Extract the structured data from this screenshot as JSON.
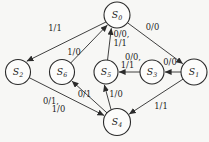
{
  "figure": {
    "type": "state-transition-diagram",
    "background_color": "#f7f7f5",
    "line_color": "#2b2b2b",
    "node_fill": "#fcfcfb",
    "states": [
      {
        "id": "s0",
        "base": "S",
        "sub": "0",
        "x": 117,
        "y": 15,
        "r": 13
      },
      {
        "id": "s1",
        "base": "S",
        "sub": "1",
        "x": 194,
        "y": 72,
        "r": 13
      },
      {
        "id": "s2",
        "base": "S",
        "sub": "2",
        "x": 18,
        "y": 72,
        "r": 12.5
      },
      {
        "id": "s3",
        "base": "S",
        "sub": "3",
        "x": 152,
        "y": 72,
        "r": 12
      },
      {
        "id": "s4",
        "base": "S",
        "sub": "4",
        "x": 117,
        "y": 122,
        "r": 13.5
      },
      {
        "id": "s5",
        "base": "S",
        "sub": "5",
        "x": 106,
        "y": 72,
        "r": 12
      },
      {
        "id": "s6",
        "base": "S",
        "sub": "6",
        "x": 62,
        "y": 72,
        "r": 12.5
      }
    ],
    "transitions": [
      {
        "from": "s0",
        "to": "s2",
        "x1": 110,
        "y1": 20,
        "x2": 26.8,
        "y2": 61.2,
        "labels": [
          {
            "text": "1/1",
            "x": 55,
            "y": 31,
            "anchor": "middle"
          }
        ]
      },
      {
        "from": "s6",
        "to": "s0",
        "labels": [
          {
            "text": "1/0",
            "x": 74,
            "y": 54.5,
            "anchor": "middle"
          }
        ]
      },
      {
        "from": "s5",
        "to": "s0",
        "x1": 107.5,
        "y1": 60.3,
        "x2": 111.3,
        "y2": 28.3,
        "labels": [
          {
            "text": "0/0,",
            "x": 113.5,
            "y": 36.5,
            "anchor": "start"
          },
          {
            "text": "1/1",
            "x": 113.5,
            "y": 45.5,
            "anchor": "start"
          }
        ]
      },
      {
        "from": "s0",
        "to": "s1",
        "labels": [
          {
            "text": "0/0",
            "x": 152.5,
            "y": 30,
            "anchor": "middle"
          }
        ]
      },
      {
        "from": "s3",
        "to": "s5",
        "labels": [
          {
            "text": "0/0,",
            "x": 133,
            "y": 59.5,
            "anchor": "middle"
          },
          {
            "text": "1/1",
            "x": 127.5,
            "y": 67.5,
            "anchor": "middle"
          }
        ]
      },
      {
        "from": "s1",
        "to": "s3",
        "labels": [
          {
            "text": "0/0",
            "x": 170,
            "y": 64.5,
            "anchor": "middle"
          }
        ]
      },
      {
        "from": "s2",
        "to": "s4",
        "labels": [
          {
            "text": "0/1,",
            "x": 51,
            "y": 103.5,
            "anchor": "middle"
          },
          {
            "text": "1/0",
            "x": 58.5,
            "y": 111.5,
            "anchor": "middle"
          }
        ]
      },
      {
        "from": "s4",
        "to": "s6",
        "labels": [
          {
            "text": "0/1",
            "x": 84.5,
            "y": 97,
            "anchor": "middle"
          }
        ]
      },
      {
        "from": "s4",
        "to": "s5",
        "x1": 111,
        "y1": 109.5,
        "x2": 104.3,
        "y2": 84.8,
        "labels": [
          {
            "text": "1/0",
            "x": 116,
            "y": 97,
            "anchor": "middle"
          }
        ]
      },
      {
        "from": "s1",
        "to": "s4",
        "labels": [
          {
            "text": "1/1",
            "x": 161,
            "y": 108.5,
            "anchor": "middle"
          }
        ]
      }
    ]
  }
}
